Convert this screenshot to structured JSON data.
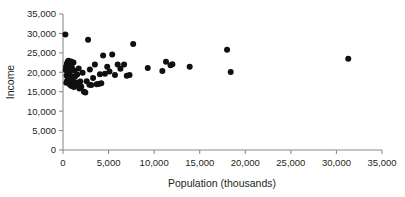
{
  "chart_data": {
    "type": "scatter",
    "title": "",
    "xlabel": "Population (thousands)",
    "ylabel": "Income",
    "xlim": [
      0,
      35000
    ],
    "ylim": [
      0,
      35000
    ],
    "grid": false,
    "legend": null,
    "xticks": [
      0,
      5000,
      10000,
      15000,
      20000,
      25000,
      30000,
      35000
    ],
    "yticks": [
      0,
      5000,
      10000,
      15000,
      20000,
      25000,
      30000,
      35000
    ],
    "xtick_labels": [
      "0",
      "5,000",
      "10,000",
      "15,000",
      "20,000",
      "25,000",
      "30,000",
      "35,000"
    ],
    "ytick_labels": [
      "0",
      "5,000",
      "10,000",
      "15,000",
      "20,000",
      "25,000",
      "30,000",
      "35,000"
    ],
    "marker": "filled-circle",
    "marker_color": "#101010",
    "marker_size": 4.6,
    "x": [
      260,
      300,
      330,
      360,
      390,
      420,
      450,
      480,
      520,
      560,
      600,
      640,
      680,
      700,
      730,
      760,
      800,
      840,
      880,
      900,
      940,
      980,
      1020,
      1080,
      1150,
      1200,
      1260,
      1320,
      1400,
      1480,
      1560,
      1640,
      1720,
      1800,
      1900,
      2000,
      2150,
      2300,
      2450,
      2600,
      2750,
      2900,
      2950,
      3100,
      3300,
      3500,
      3700,
      3900,
      4050,
      4200,
      4400,
      4600,
      4850,
      5100,
      5400,
      5700,
      6000,
      6300,
      6700,
      7000,
      7300,
      7700,
      9300,
      10900,
      11300,
      11800,
      12000,
      13900,
      18000,
      18400,
      31300
    ],
    "y": [
      29700,
      20600,
      21400,
      17300,
      19200,
      22200,
      17800,
      20200,
      22700,
      18200,
      23000,
      21600,
      17500,
      19700,
      22400,
      16800,
      20900,
      17100,
      22800,
      19000,
      16500,
      21200,
      18600,
      17900,
      22500,
      16200,
      20400,
      18900,
      16600,
      17400,
      19400,
      16900,
      21000,
      15800,
      17600,
      16300,
      19900,
      15000,
      14800,
      17700,
      28400,
      16800,
      20700,
      16700,
      18500,
      22000,
      16900,
      17000,
      19500,
      17200,
      24300,
      19600,
      21400,
      20200,
      24600,
      19300,
      22000,
      20900,
      22000,
      19100,
      19300,
      27300,
      21100,
      20300,
      22700,
      21800,
      22100,
      21400,
      25800,
      20100,
      23500
    ]
  },
  "axes": {
    "x_axis_name": "x-axis",
    "y_axis_name": "y-axis"
  }
}
